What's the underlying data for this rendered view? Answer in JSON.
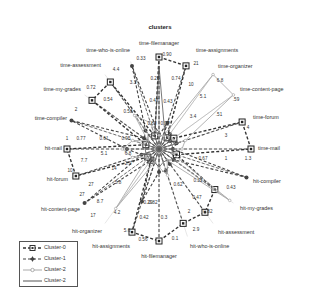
{
  "chart_data": {
    "type": "radar",
    "title": "clusters",
    "axes": [
      "time-filemanager",
      "time-assignments",
      "time-organizer",
      "time-content-page",
      "time-forum",
      "time-mail",
      "hit-compiler",
      "hit-my-grades",
      "hit-assessment",
      "hit-who-is-online",
      "hit-filemanager",
      "hit-assignments",
      "hit-organizer",
      "hit-content-page",
      "hit-forum",
      "hit-mail",
      "time-compiler",
      "time-my-grades",
      "time-assessment",
      "time-who-is-online"
    ],
    "series": [
      {
        "name": "Cluster-0",
        "style": "dashed-square-marker",
        "color": "#333333",
        "values": [
          1.0,
          0.95,
          0.15,
          0.2,
          0.95,
          1.0,
          0.2,
          0.75,
          0.85,
          0.85,
          1.0,
          0.95,
          0.15,
          0.15,
          0.95,
          1.0,
          0.15,
          0.9,
          0.9,
          0.15
        ]
      },
      {
        "name": "Cluster-1",
        "style": "dashed-star-marker",
        "color": "#444444",
        "values": [
          0.15,
          0.3,
          0.2,
          0.15,
          0.2,
          0.15,
          1.0,
          0.2,
          0.2,
          0.25,
          0.25,
          0.6,
          0.15,
          1.0,
          0.2,
          0.35,
          1.0,
          0.2,
          0.25,
          0.95
        ]
      },
      {
        "name": "Cluster-2",
        "style": "light-solid-circle-marker",
        "color": "#aaaaaa",
        "values": [
          0.15,
          0.15,
          1.0,
          1.0,
          0.3,
          0.25,
          0.15,
          0.95,
          0.15,
          0.3,
          0.2,
          0.15,
          0.8,
          0.15,
          0.3,
          0.4,
          0.3,
          0.15,
          0.45,
          0.3
        ]
      },
      {
        "name": "Cluster-2",
        "style": "solid-line",
        "color": "#555555",
        "values": [
          0.9,
          0.2,
          0.15,
          0.15,
          0.15,
          0.15,
          0.15,
          0.2,
          0.15,
          0.15,
          0.2,
          0.15,
          0.15,
          0.15,
          0.15,
          0.15,
          0.15,
          0.15,
          0.2,
          0.15
        ]
      }
    ],
    "value_labels": [
      {
        "text": "0.33",
        "x": 141,
        "y": 60
      },
      {
        "text": "0.90",
        "x": 167,
        "y": 56
      },
      {
        "text": "21",
        "x": 196,
        "y": 65
      },
      {
        "text": "4.4",
        "x": 116,
        "y": 71
      },
      {
        "text": "6.8",
        "x": 220,
        "y": 82
      },
      {
        "text": "0.72",
        "x": 91,
        "y": 89
      },
      {
        "text": "3.3",
        "x": 133,
        "y": 84
      },
      {
        "text": "0.25",
        "x": 155,
        "y": 80
      },
      {
        "text": "0.74",
        "x": 176,
        "y": 80
      },
      {
        "text": "10",
        "x": 191,
        "y": 86
      },
      {
        "text": ".59",
        "x": 236,
        "y": 101
      },
      {
        "text": "0.54",
        "x": 108,
        "y": 101
      },
      {
        "text": "0.47",
        "x": 154,
        "y": 102
      },
      {
        "text": "0.43",
        "x": 168,
        "y": 103
      },
      {
        "text": "5.1",
        "x": 203,
        "y": 98
      },
      {
        "text": "0.58",
        "x": 128,
        "y": 113
      },
      {
        "text": ".51",
        "x": 219,
        "y": 116
      },
      {
        "text": "2",
        "x": 76,
        "y": 111
      },
      {
        "text": "3.4",
        "x": 193,
        "y": 118
      },
      {
        "text": "4",
        "x": 248,
        "y": 129
      },
      {
        "text": "0.80",
        "x": 152,
        "y": 125
      },
      {
        "text": "0.97",
        "x": 165,
        "y": 125
      },
      {
        "text": "3",
        "x": 226,
        "y": 137
      },
      {
        "text": "1",
        "x": 67,
        "y": 140
      },
      {
        "text": "0.77",
        "x": 81,
        "y": 140
      },
      {
        "text": "0.61",
        "x": 104,
        "y": 140
      },
      {
        "text": "0.95",
        "x": 126,
        "y": 140
      },
      {
        "text": "7.7",
        "x": 84,
        "y": 162
      },
      {
        "text": "5.1",
        "x": 104,
        "y": 155
      },
      {
        "text": "6.8",
        "x": 128,
        "y": 155
      },
      {
        "text": "0.67",
        "x": 203,
        "y": 160
      },
      {
        "text": "1",
        "x": 226,
        "y": 160
      },
      {
        "text": "1.3",
        "x": 248,
        "y": 160
      },
      {
        "text": "10",
        "x": 70,
        "y": 172
      },
      {
        "text": "14",
        "x": 114,
        "y": 170
      },
      {
        "text": "2.9",
        "x": 128,
        "y": 165
      },
      {
        "text": "0.32",
        "x": 198,
        "y": 182
      },
      {
        "text": "0.43",
        "x": 231,
        "y": 189
      },
      {
        "text": "27",
        "x": 91,
        "y": 186
      },
      {
        "text": "5.8",
        "x": 118,
        "y": 184
      },
      {
        "text": "0.62",
        "x": 178,
        "y": 186
      },
      {
        "text": "27",
        "x": 82,
        "y": 196
      },
      {
        "text": "8.7",
        "x": 100,
        "y": 203
      },
      {
        "text": "0.47",
        "x": 197,
        "y": 199
      },
      {
        "text": "0.29",
        "x": 148,
        "y": 204
      },
      {
        "text": "0.82",
        "x": 153,
        "y": 204
      },
      {
        "text": "0.82",
        "x": 208,
        "y": 213
      },
      {
        "text": "4.2",
        "x": 117,
        "y": 214
      },
      {
        "text": "17",
        "x": 93,
        "y": 217
      },
      {
        "text": "0.42",
        "x": 144,
        "y": 219
      },
      {
        "text": "0.3",
        "x": 164,
        "y": 219
      },
      {
        "text": "2",
        "x": 189,
        "y": 213
      },
      {
        "text": "2.9",
        "x": 196,
        "y": 231
      },
      {
        "text": "5.6",
        "x": 127,
        "y": 232
      },
      {
        "text": "0.56",
        "x": 143,
        "y": 241
      },
      {
        "text": "0.1",
        "x": 175,
        "y": 240
      }
    ],
    "legend_position": "bottom-left",
    "grid": false
  },
  "legend": {
    "items": [
      {
        "label": "Cluster-0"
      },
      {
        "label": "Cluster-1"
      },
      {
        "label": "Cluster-2"
      },
      {
        "label": "Cluster-2"
      }
    ]
  }
}
